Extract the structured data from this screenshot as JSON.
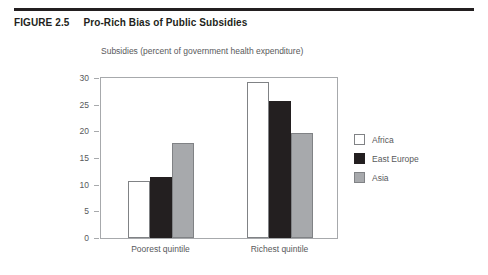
{
  "figure": {
    "number": "FIGURE 2.5",
    "title": "Pro-Rich Bias of Public Subsidies"
  },
  "chart_data": {
    "type": "bar",
    "title": "",
    "xlabel": "",
    "ylabel": "Subsidies (percent of government health expenditure)",
    "categories": [
      "Poorest quintile",
      "Richest quintile"
    ],
    "series": [
      {
        "name": "Africa",
        "values": [
          10.7,
          29.3
        ],
        "color": "#ffffff"
      },
      {
        "name": "East Europe",
        "values": [
          11.4,
          25.7
        ],
        "color": "#231f20"
      },
      {
        "name": "Asia",
        "values": [
          17.8,
          19.6
        ],
        "color": "#a7a9ac"
      }
    ],
    "ylim": [
      0,
      30
    ],
    "yticks": [
      0,
      5,
      10,
      15,
      20,
      25,
      30
    ],
    "ytick_labels": [
      "0",
      "5",
      "10",
      "15",
      "20",
      "25",
      "30"
    ],
    "grid": false,
    "legend_position": "right"
  },
  "legend": {
    "items": [
      {
        "label": "Africa"
      },
      {
        "label": "East Europe"
      },
      {
        "label": "Asia"
      }
    ]
  }
}
